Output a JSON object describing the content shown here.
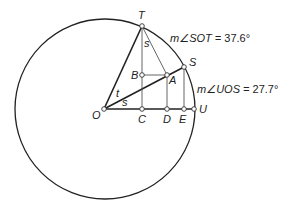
{
  "diagram": {
    "type": "geometry-unit-circle",
    "circle": {
      "cx": 105,
      "cy": 109,
      "r": 90,
      "stroke": "#222222"
    },
    "points": {
      "O": {
        "x": 104,
        "y": 109,
        "label": "O",
        "lx": 92,
        "ly": 119
      },
      "T": {
        "x": 142,
        "y": 26,
        "label": "T",
        "lx": 138,
        "ly": 19
      },
      "S": {
        "x": 184,
        "y": 67,
        "label": "S",
        "lx": 189,
        "ly": 66
      },
      "U": {
        "x": 194,
        "y": 109,
        "label": "U",
        "lx": 199,
        "ly": 113
      },
      "A": {
        "x": 167,
        "y": 75,
        "label": "A",
        "lx": 169,
        "ly": 84
      },
      "B": {
        "x": 142,
        "y": 75,
        "label": "B",
        "lx": 131,
        "ly": 79
      },
      "C": {
        "x": 142,
        "y": 109,
        "label": "C",
        "lx": 138,
        "ly": 123
      },
      "D": {
        "x": 167,
        "y": 109,
        "label": "D",
        "lx": 163,
        "ly": 123
      },
      "E": {
        "x": 184,
        "y": 109,
        "label": "E",
        "lx": 179,
        "ly": 123
      }
    },
    "angle_labels": {
      "t": {
        "text": "t",
        "x": 116,
        "y": 97
      },
      "s_at_O": {
        "text": "s",
        "x": 122,
        "y": 106
      },
      "s_at_T": {
        "text": "s",
        "x": 144,
        "y": 47
      }
    },
    "annotations": {
      "sot": {
        "prefix": "m∠SOT = ",
        "value": "37.6°",
        "x": 170,
        "y": 42
      },
      "uos": {
        "prefix": "m∠UOS = ",
        "value": "27.7°",
        "x": 197,
        "y": 93
      }
    }
  }
}
